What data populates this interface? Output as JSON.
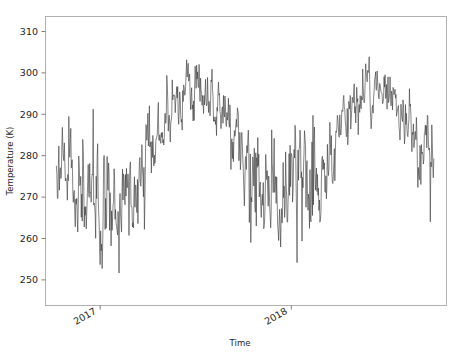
{
  "chart_data": {
    "type": "line",
    "title": "",
    "xlabel": "Time",
    "ylabel": "Temperature (K)",
    "x_tick_labels": [
      "2017",
      "2018"
    ],
    "x_tick_values": [
      2017.0,
      2018.0
    ],
    "y_tick_labels": [
      "250",
      "260",
      "270",
      "280",
      "290",
      "300",
      "310"
    ],
    "y_tick_values": [
      250,
      260,
      270,
      280,
      290,
      300,
      310
    ],
    "ylim": [
      243.5,
      312.5
    ],
    "xlim": [
      2016.72,
      2018.93
    ],
    "grid": false,
    "legend": null,
    "line_color": "#3b3b3b",
    "series": [
      {
        "name": "Temperature (K)",
        "description": "Daily surface air temperature, two full seasonal cycles with large day-to-day variability",
        "x_start": 2016.78,
        "x_end": 2018.86,
        "n_points": 760,
        "seasonal_mean_summer": 295.0,
        "seasonal_mean_winter": 268.0,
        "annual_mean": 281.5,
        "daily_noise_sd": 4.6,
        "observed_max": 308.0,
        "observed_min": 244.0,
        "summer_peak_2017": 307.5,
        "summer_peak_2018": 308.0,
        "winter_min_2016_17": 244.0,
        "winter_min_2017_18": 246.5,
        "value_at_series_end": 275.0
      }
    ]
  },
  "axes": {
    "y_axis_label": "Temperature (K)",
    "x_axis_label": "Time"
  }
}
